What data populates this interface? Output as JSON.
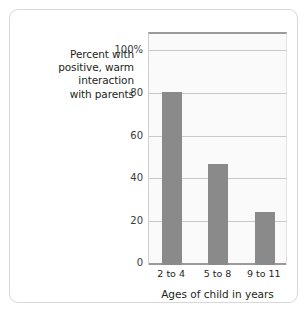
{
  "figure": {
    "background_color": "#ffffff",
    "border_color": "#d8d8d8",
    "plot_background_color": "#fafafa",
    "bar_color": "#8a8a8a",
    "gridline_color": "#c9c9c9",
    "axis_color": "#9a9a9a",
    "text_color": "#231f20"
  },
  "y_axis_caption": {
    "lines": [
      "Percent with",
      "positive, warm",
      "interaction",
      "with parents"
    ]
  },
  "chart_data": {
    "type": "bar",
    "title": "",
    "subtitle": "",
    "categories": [
      "2 to 4",
      "5 to 8",
      "9 to 11"
    ],
    "values": [
      81,
      47,
      25
    ],
    "series": [
      {
        "name": "Percent with positive, warm interaction with parents",
        "values": [
          81,
          47,
          25
        ]
      }
    ],
    "xlabel": "Ages of child in years",
    "ylabel": "Percent with positive, warm interaction with parents",
    "ylim": [
      0,
      108
    ],
    "yticks": [
      0,
      20,
      40,
      60,
      80,
      100
    ],
    "ytick_labels": [
      "0",
      "20",
      "40",
      "60",
      "80",
      "100%"
    ],
    "xtick_labels": [
      "2 to 4",
      "5 to 8",
      "9 to 11"
    ],
    "grid": true,
    "grid_axis": "y",
    "legend": false,
    "legend_position": "none",
    "annotations": [],
    "bar_color": "#8a8a8a"
  }
}
